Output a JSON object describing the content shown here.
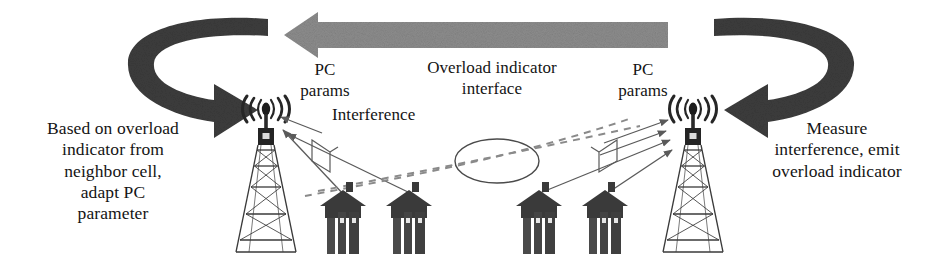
{
  "figure": {
    "kind": "network-diagram"
  },
  "labels": {
    "left_policy": "Based on overload\nindicator from\nneighbor cell,\nadapt PC\nparameter",
    "right_policy": "Measure\ninterference, emit\noverload indicator",
    "overload_indicator_interface": "Overload indicator\ninterface",
    "interference": "Interference",
    "pc_params_left": "PC\nparams",
    "pc_params_right": "PC\nparams"
  },
  "nodes": {
    "tower_left": "base-station-tower-left",
    "tower_right": "base-station-tower-right",
    "terminals_left": [
      "user-terminal-1",
      "user-terminal-2"
    ],
    "terminals_right": [
      "user-terminal-3",
      "user-terminal-4"
    ]
  },
  "connections": {
    "overload_indicator_arrow": {
      "name": "overload-indicator-arrow",
      "direction": "right-to-left",
      "style": "solid-block",
      "color": "#8d8d8d"
    },
    "feedback_loop_left": {
      "name": "power-control-feedback-loop-left",
      "style": "curved-block",
      "color": "#3c3c3c"
    },
    "feedback_loop_right": {
      "name": "overload-measurement-loop-right",
      "style": "curved-block",
      "color": "#3c3c3c"
    },
    "interference_paths": {
      "name": "interference-dashed-paths",
      "style": "dashed",
      "color": "#8a8a8a",
      "count": 2
    },
    "serving_links_left": {
      "name": "serving-links-left",
      "style": "solid-thin",
      "color": "#5a5a5a",
      "count": 2
    },
    "serving_links_right": {
      "name": "serving-links-right",
      "style": "solid-thin",
      "color": "#5a5a5a",
      "count": 2
    }
  },
  "colors": {
    "background": "#ffffff",
    "dark_arrow": "#3c3c3c",
    "gray_arrow": "#8d8d8d",
    "line": "#5a5a5a",
    "dashed": "#8a8a8a",
    "text": "#141414",
    "structure": "#333333"
  }
}
